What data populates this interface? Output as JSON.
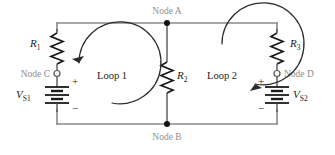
{
  "figure": {
    "type": "circuit-schematic",
    "background_color": "#ffffff",
    "wire_color": "#8a8a8a",
    "node_label_color": "#8f8f8f",
    "component_color": "#1a1a1a"
  },
  "nodes": [
    {
      "id": "A",
      "label": "Node A",
      "type": "junction",
      "position": "top-center"
    },
    {
      "id": "B",
      "label": "Node B",
      "type": "junction",
      "position": "bottom-center"
    },
    {
      "id": "C",
      "label": "Node C",
      "type": "terminal",
      "position": "left-middle"
    },
    {
      "id": "D",
      "label": "Node D",
      "type": "terminal",
      "position": "right-middle"
    }
  ],
  "resistors": [
    {
      "id": "R1",
      "name": "R",
      "subscript": "1",
      "position": "left-branch"
    },
    {
      "id": "R2",
      "name": "R",
      "subscript": "2",
      "position": "center-branch"
    },
    {
      "id": "R3",
      "name": "R",
      "subscript": "3",
      "position": "right-branch"
    }
  ],
  "sources": [
    {
      "id": "VS1",
      "name": "V",
      "subscript": "S1",
      "position": "left-branch",
      "plus_label": "+",
      "minus_label": "−",
      "plus_position": "top",
      "minus_position": "bottom"
    },
    {
      "id": "VS2",
      "name": "V",
      "subscript": "S2",
      "position": "right-branch",
      "plus_label": "+",
      "minus_label": "−",
      "plus_position": "top",
      "minus_position": "bottom"
    }
  ],
  "loops": [
    {
      "id": "loop1",
      "label": "Loop 1",
      "direction": "clockwise",
      "arrow_at": "lower-left"
    },
    {
      "id": "loop2",
      "label": "Loop 2",
      "direction": "clockwise",
      "arrow_at": "lower-right"
    }
  ]
}
